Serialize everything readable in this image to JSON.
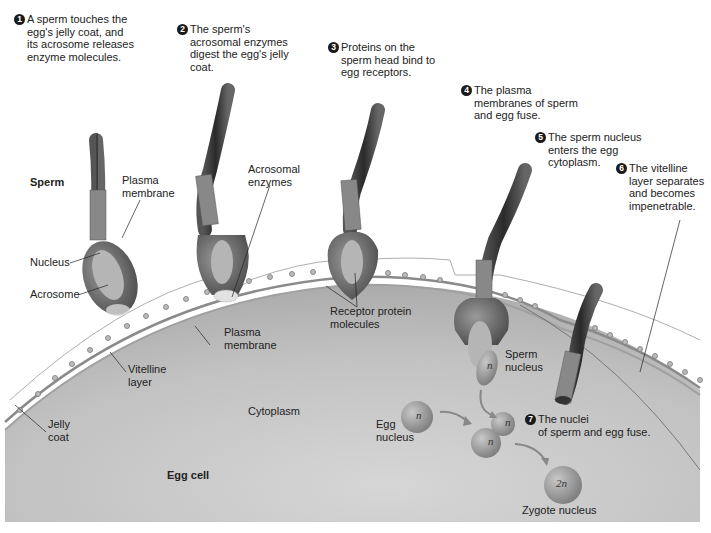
{
  "steps": [
    {
      "num": "1",
      "text": "A sperm touches the\negg's jelly coat, and\nits acrosome releases\nenzyme molecules."
    },
    {
      "num": "2",
      "text": "The sperm's\nacrosomal enzymes\ndigest the egg's jelly\ncoat."
    },
    {
      "num": "3",
      "text": "Proteins on the\nsperm head bind to\negg receptors."
    },
    {
      "num": "4",
      "text": "The plasma\nmembranes of sperm\nand egg fuse."
    },
    {
      "num": "5",
      "text": "The sperm nucleus\nenters the egg\ncytoplasm."
    },
    {
      "num": "6",
      "text": "The vitelline\nlayer separates\nand becomes\nimpenetrable."
    },
    {
      "num": "7",
      "text": "The nuclei\nof sperm and egg fuse."
    }
  ],
  "labels": {
    "sperm": "Sperm",
    "plasma_membrane_sperm": "Plasma\nmembrane",
    "nucleus": "Nucleus",
    "acrosome": "Acrosome",
    "acrosomal_enzymes": "Acrosomal\nenzymes",
    "receptor_protein": "Receptor protein\nmolecules",
    "plasma_membrane_egg": "Plasma\nmembrane",
    "vitelline_layer": "Vitelline\nlayer",
    "jelly_coat": "Jelly\ncoat",
    "cytoplasm": "Cytoplasm",
    "egg_cell": "Egg cell",
    "sperm_nucleus": "Sperm\nnucleus",
    "egg_nucleus": "Egg\nnucleus",
    "zygote_nucleus": "Zygote nucleus"
  },
  "ploidy": {
    "sperm_n": "n",
    "egg_n": "n",
    "fused_n1": "n",
    "fused_n2": "n",
    "zygote": "2n"
  },
  "colors": {
    "egg_fill": "#bdbdbd",
    "membrane": "#8a8a8a",
    "sperm_dark": "#3a3a3a",
    "nucleus": "#9a9a9a"
  }
}
